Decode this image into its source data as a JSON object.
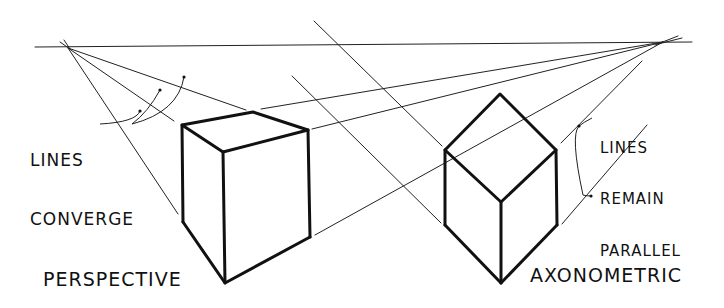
{
  "diagram": {
    "title_left": "PERSPECTIVE",
    "title_right": "AXONOMETRIC",
    "annotation_left": {
      "line1": "LINES",
      "line2": "CONVERGE"
    },
    "annotation_right": {
      "line1": "LINES",
      "line2": "REMAIN",
      "line3": "PARALLEL"
    },
    "colors": {
      "ink": "#111111",
      "background": "#ffffff"
    }
  }
}
